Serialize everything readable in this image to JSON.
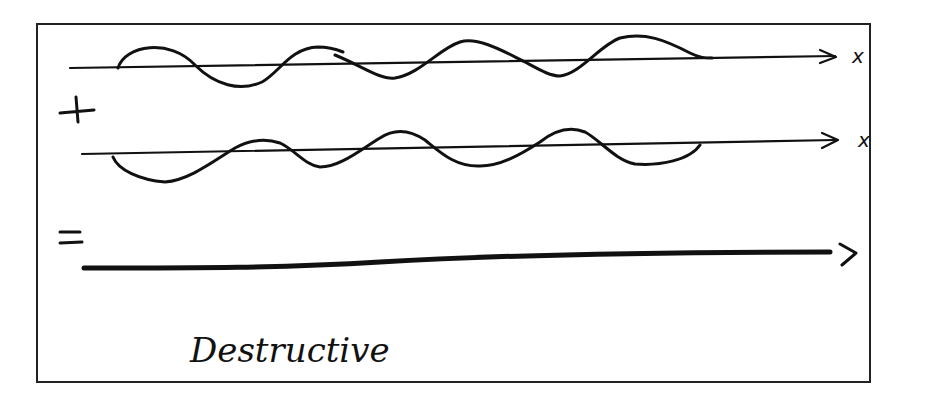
{
  "diagram": {
    "rows": [
      {
        "name": "wave-1",
        "axis_label": "x"
      },
      {
        "name": "wave-2",
        "axis_label": "x"
      },
      {
        "name": "result",
        "axis_label": ""
      }
    ],
    "operators": {
      "plus": "+",
      "equals": "="
    },
    "caption": "Destructive",
    "colors": {
      "ink": "#111111",
      "frame": "#222222",
      "background": "#ffffff"
    }
  }
}
